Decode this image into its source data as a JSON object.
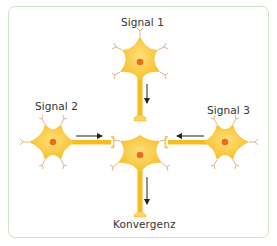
{
  "diagram": {
    "title": "Konvergenz",
    "labels": {
      "signal1": "Signal 1",
      "signal2": "Signal 2",
      "signal3": "Signal 3",
      "output": "Konvergenz"
    },
    "colors": {
      "frame_border": "#cfe3c6",
      "soma": "#f9c22e",
      "soma_light": "#fbd65a",
      "nucleus": "#ec6b1f",
      "dendrite_tip": "#e8b08f",
      "arrow": "#222222"
    },
    "nodes": [
      {
        "id": "neuron-signal-1",
        "role": "input",
        "label": "Signal 1",
        "cx": 140,
        "cy": 62
      },
      {
        "id": "neuron-signal-2",
        "role": "input",
        "label": "Signal 2",
        "cx": 53,
        "cy": 142
      },
      {
        "id": "neuron-signal-3",
        "role": "input",
        "label": "Signal 3",
        "cx": 225,
        "cy": 142
      },
      {
        "id": "neuron-target",
        "role": "convergence",
        "label": "Konvergenz",
        "cx": 140,
        "cy": 155
      }
    ],
    "edges": [
      {
        "from": "neuron-signal-1",
        "to": "neuron-target",
        "direction": "down"
      },
      {
        "from": "neuron-signal-2",
        "to": "neuron-target",
        "direction": "right"
      },
      {
        "from": "neuron-signal-3",
        "to": "neuron-target",
        "direction": "left"
      },
      {
        "from": "neuron-target",
        "to": "output",
        "direction": "down"
      }
    ]
  }
}
